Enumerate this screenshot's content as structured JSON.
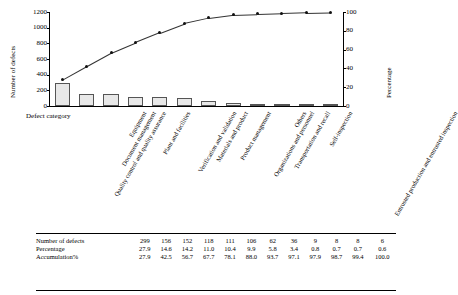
{
  "chart_data": {
    "type": "bar",
    "title": "",
    "xlabel": "Defect category",
    "ylabel": "Number of defects",
    "y2label": "Percentage",
    "ylim": [
      0,
      1200
    ],
    "y2lim": [
      0,
      100
    ],
    "yticks": [
      0,
      200,
      400,
      600,
      800,
      1000,
      1200
    ],
    "y2ticks": [
      0,
      20,
      40,
      60,
      80,
      100
    ],
    "grid": false,
    "legend": "none",
    "categories": [
      "Quality control and quality assurance",
      "Document management",
      "Equipment",
      "Plant and facilities",
      "Verification and validation",
      "Materials and product",
      "Product management",
      "Organizations and personnel",
      "Transportation and recall",
      "Others",
      "Self-inspection",
      "Entrusted production and entrusted inspection"
    ],
    "series": [
      {
        "name": "Number of defects",
        "type": "bar",
        "values": [
          299,
          156,
          152,
          118,
          111,
          106,
          62,
          36,
          9,
          8,
          8,
          6
        ]
      },
      {
        "name": "Accumulation%",
        "type": "line",
        "values": [
          27.9,
          42.5,
          56.7,
          67.7,
          78.1,
          88.0,
          93.7,
          97.1,
          97.9,
          98.7,
          99.4,
          100.0
        ]
      }
    ],
    "percentage": [
      27.9,
      14.6,
      14.2,
      11.0,
      10.4,
      9.9,
      5.8,
      3.4,
      0.8,
      0.7,
      0.7,
      0.6
    ]
  },
  "axes": {
    "y_left_label": "Number of defects",
    "y_right_label": "Percentage",
    "x_label": "Defect category",
    "y_left_ticks": [
      "0",
      "200",
      "400",
      "600",
      "800",
      "1000",
      "1200"
    ],
    "y_right_ticks": [
      "0",
      "20",
      "40",
      "60",
      "80",
      "100"
    ]
  },
  "table": {
    "rows": [
      {
        "header": "Number of defects",
        "values": [
          "299",
          "156",
          "152",
          "118",
          "111",
          "106",
          "62",
          "36",
          "9",
          "8",
          "8",
          "6"
        ]
      },
      {
        "header": "Percentage",
        "values": [
          "27.9",
          "14.6",
          "14.2",
          "11.0",
          "10.4",
          "9.9",
          "5.8",
          "3.4",
          "0.8",
          "0.7",
          "0.7",
          "0.6"
        ]
      },
      {
        "header": "Accumulation%",
        "values": [
          "27.9",
          "42.5",
          "56.7",
          "67.7",
          "78.1",
          "88.0",
          "93.7",
          "97.1",
          "97.9",
          "98.7",
          "99.4",
          "100.0"
        ]
      }
    ]
  }
}
